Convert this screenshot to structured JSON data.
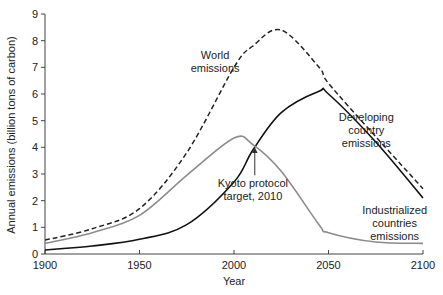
{
  "chart_data": {
    "type": "line",
    "title": "",
    "xlabel": "Year",
    "ylabel": "Annual emissions (billion tons of carbon)",
    "xlim": [
      1900,
      2100
    ],
    "ylim": [
      0,
      9
    ],
    "x_ticks": [
      1900,
      1950,
      2000,
      2050,
      2100
    ],
    "y_ticks": [
      0,
      1,
      2,
      3,
      4,
      5,
      6,
      7,
      8,
      9
    ],
    "grid": false,
    "legend": "none (inline annotations)",
    "x": [
      1900,
      1925,
      1950,
      1975,
      2000,
      2010,
      2025,
      2045,
      2050,
      2075,
      2100
    ],
    "series": [
      {
        "name": "World emissions",
        "style": "dashed",
        "color": "#222222",
        "values": [
          0.52,
          0.95,
          1.7,
          3.8,
          7.0,
          7.8,
          8.4,
          7.0,
          6.4,
          4.4,
          2.45
        ]
      },
      {
        "name": "Developing country emissions",
        "style": "solid",
        "color": "#111111",
        "values": [
          0.15,
          0.3,
          0.55,
          1.1,
          2.7,
          3.9,
          5.3,
          6.1,
          6.0,
          4.2,
          2.1
        ]
      },
      {
        "name": "Industrialized countries emissions",
        "style": "solid",
        "color": "#8c8c8c",
        "values": [
          0.4,
          0.8,
          1.45,
          2.95,
          4.35,
          4.1,
          3.1,
          1.1,
          0.8,
          0.45,
          0.4
        ]
      }
    ],
    "annotations": [
      {
        "text": [
          "World",
          "emissions"
        ],
        "x": 1990,
        "y": 7.3
      },
      {
        "text": [
          "Developing",
          "country",
          "emissions"
        ],
        "x": 2070,
        "y": 5.0
      },
      {
        "text": [
          "Kyoto protocol",
          "target, 2010"
        ],
        "x": 2010,
        "y": 2.5,
        "arrow_to": [
          2011,
          4.0
        ]
      },
      {
        "text": [
          "Industrialized",
          "countries",
          "emissions"
        ],
        "x": 2085,
        "y": 1.5
      }
    ]
  }
}
